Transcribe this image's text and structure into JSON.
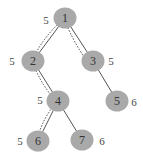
{
  "diagram": {
    "type": "binary-tree-traversal",
    "colors": {
      "node_fill": "#a9a9a9",
      "edge": "#555555",
      "dotted_path": "#333333",
      "text": "#333333"
    },
    "nodes": [
      {
        "id": "1",
        "label": "1",
        "cx": 65,
        "cy": 18,
        "side_label": "5",
        "side_x": 46,
        "side_y": 20
      },
      {
        "id": "2",
        "label": "2",
        "cx": 33,
        "cy": 61,
        "side_label": "5",
        "side_x": 12,
        "side_y": 61
      },
      {
        "id": "3",
        "label": "3",
        "cx": 93,
        "cy": 61,
        "side_label": "5",
        "side_x": 111,
        "side_y": 61
      },
      {
        "id": "4",
        "label": "4",
        "cx": 58,
        "cy": 101,
        "side_label": "5",
        "side_x": 40,
        "side_y": 100
      },
      {
        "id": "5",
        "label": "5",
        "cx": 117,
        "cy": 101,
        "side_label": "6",
        "side_x": 134,
        "side_y": 102
      },
      {
        "id": "6",
        "label": "6",
        "cx": 38,
        "cy": 141,
        "side_label": "5",
        "side_x": 20,
        "side_y": 141
      },
      {
        "id": "7",
        "label": "7",
        "cx": 82,
        "cy": 140,
        "side_label": "6",
        "side_x": 102,
        "side_y": 141
      }
    ],
    "edges": [
      {
        "from": "1",
        "to": "2"
      },
      {
        "from": "1",
        "to": "3"
      },
      {
        "from": "2",
        "to": "4"
      },
      {
        "from": "3",
        "to": "5"
      },
      {
        "from": "4",
        "to": "6"
      },
      {
        "from": "4",
        "to": "7"
      }
    ],
    "dotted_path": [
      "3",
      "1",
      "2",
      "4",
      "6"
    ]
  }
}
